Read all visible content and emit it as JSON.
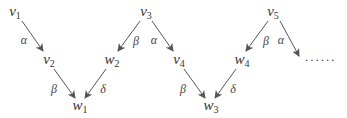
{
  "diagram": {
    "nodes": [
      {
        "id": "v1",
        "base": "v",
        "sub": "1"
      },
      {
        "id": "v2",
        "base": "v",
        "sub": "2"
      },
      {
        "id": "w1",
        "base": "w",
        "sub": "1"
      },
      {
        "id": "w2",
        "base": "w",
        "sub": "2"
      },
      {
        "id": "v3",
        "base": "v",
        "sub": "3"
      },
      {
        "id": "v4",
        "base": "v",
        "sub": "4"
      },
      {
        "id": "w3",
        "base": "w",
        "sub": "3"
      },
      {
        "id": "w4",
        "base": "w",
        "sub": "4"
      },
      {
        "id": "v5",
        "base": "v",
        "sub": "5"
      }
    ],
    "edges": [
      {
        "from": "v1",
        "to": "v2",
        "label": "α"
      },
      {
        "from": "v2",
        "to": "w1",
        "label": "β"
      },
      {
        "from": "w2",
        "to": "w1",
        "label": "δ"
      },
      {
        "from": "v3",
        "to": "w2",
        "label": "β"
      },
      {
        "from": "v3",
        "to": "v4",
        "label": "α"
      },
      {
        "from": "v4",
        "to": "w3",
        "label": "β"
      },
      {
        "from": "w4",
        "to": "w3",
        "label": "δ"
      },
      {
        "from": "v5",
        "to": "w4",
        "label": "β"
      },
      {
        "from": "v5",
        "to": "continuation",
        "label": "α"
      }
    ],
    "continuation": "......"
  }
}
